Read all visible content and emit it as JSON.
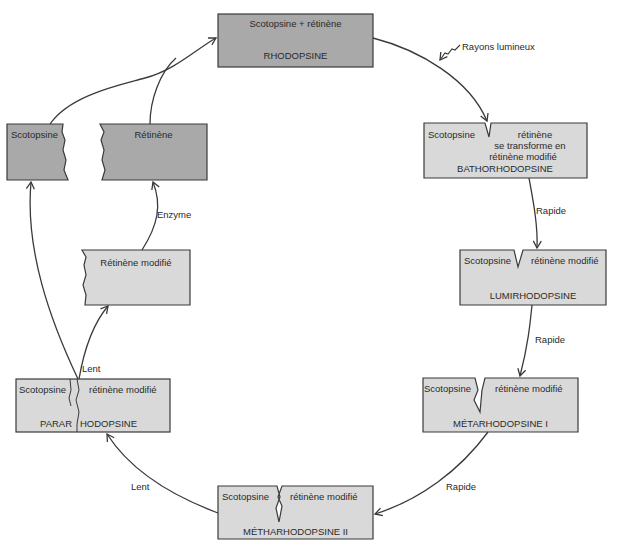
{
  "diagram": {
    "colors": {
      "dark_box": "#a9a9a9",
      "light_box": "#d9d9d9",
      "stroke": "#3a3a3a",
      "background": "#ffffff"
    },
    "nodes": {
      "rhodopsine": {
        "top": "Scotopsine + rétinène",
        "name": "RHODOPSINE"
      },
      "bathorhodopsine": {
        "left": "Scotopsine",
        "right": "rétinène",
        "line2": "se transforme en",
        "line3": "rétinène modifié",
        "name": "BATHORHODOPSINE"
      },
      "lumirhodopsine": {
        "left": "Scotopsine",
        "right": "rétinène modifié",
        "name": "LUMIRHODOPSINE"
      },
      "metarhodopsine1": {
        "left": "Scotopsine",
        "right": "rétinène modifié",
        "name": "MÉTARHODOPSINE I"
      },
      "metharhodopsine2": {
        "left": "Scotopsine",
        "right": "rétinène modifié",
        "name": "MÉTHARHODOPSINE II"
      },
      "pararhodopsine": {
        "left": "Scotopsine",
        "right": "rétinène modifié",
        "name_left": "PARAR",
        "name_right": "HODOPSINE"
      },
      "retinene_modifie": {
        "label": "Rétinène modifié"
      },
      "scotopsine": {
        "label": "Scotopsine"
      },
      "retinene": {
        "label": "Rétinène"
      }
    },
    "edge_labels": {
      "light": "Rayons lumineux",
      "rapide1": "Rapide",
      "rapide2": "Rapide",
      "rapide3": "Rapide",
      "lent1": "Lent",
      "lent2": "Lent",
      "enzyme": "Enzyme"
    }
  }
}
